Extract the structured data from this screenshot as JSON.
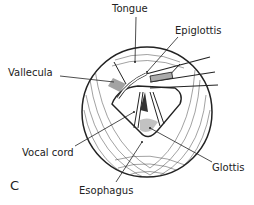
{
  "figure": {
    "panel_label": "C",
    "labels": {
      "tongue": "Tongue",
      "epiglottis": "Epiglottis",
      "vallecula": "Vallecula",
      "vocal_cord": "Vocal cord",
      "glottis": "Glottis",
      "esophagus": "Esophagus"
    },
    "colors": {
      "stroke": "#222222",
      "background": "#ffffff",
      "shade": "#555555"
    }
  }
}
